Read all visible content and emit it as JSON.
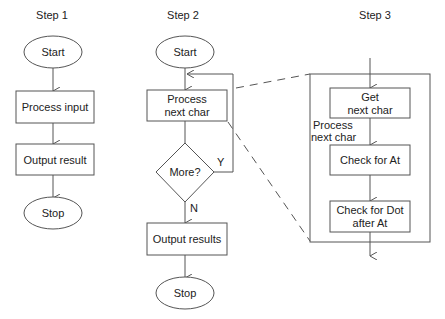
{
  "steps": [
    {
      "title": "Step 1",
      "nodes": {
        "start": "Start",
        "process": "Process input",
        "output": "Output result",
        "stop": "Stop"
      }
    },
    {
      "title": "Step 2",
      "nodes": {
        "start": "Start",
        "process_l1": "Process",
        "process_l2": "next char",
        "decision": "More?",
        "yes_label": "Y",
        "no_label": "N",
        "output": "Output results",
        "stop": "Stop"
      }
    },
    {
      "title": "Step 3",
      "container_label_l1": "Process",
      "container_label_l2": "next char",
      "nodes": {
        "get_l1": "Get",
        "get_l2": "next char",
        "check_at": "Check for At",
        "check_dot_l1": "Check for Dot",
        "check_dot_l2": "after At"
      }
    }
  ]
}
